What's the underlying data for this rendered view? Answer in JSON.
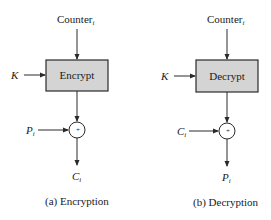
{
  "diagram": {
    "encryption": {
      "counter_label": "Counter",
      "counter_subscript": "i",
      "key_label": "K",
      "block_label": "Encrypt",
      "input_label": "P",
      "input_subscript": "i",
      "output_label": "C",
      "output_subscript": "i",
      "xor_symbol": "+",
      "caption": "(a) Encryption"
    },
    "decryption": {
      "counter_label": "Counter",
      "counter_subscript": "i",
      "key_label": "K",
      "block_label": "Decrypt",
      "input_label": "C",
      "input_subscript": "i",
      "output_label": "P",
      "output_subscript": "i",
      "xor_symbol": "+",
      "caption": "(b) Decryption"
    },
    "colors": {
      "block_fill": "#d4d4d4",
      "stroke": "#2a2a2a",
      "background": "#ffffff"
    }
  }
}
